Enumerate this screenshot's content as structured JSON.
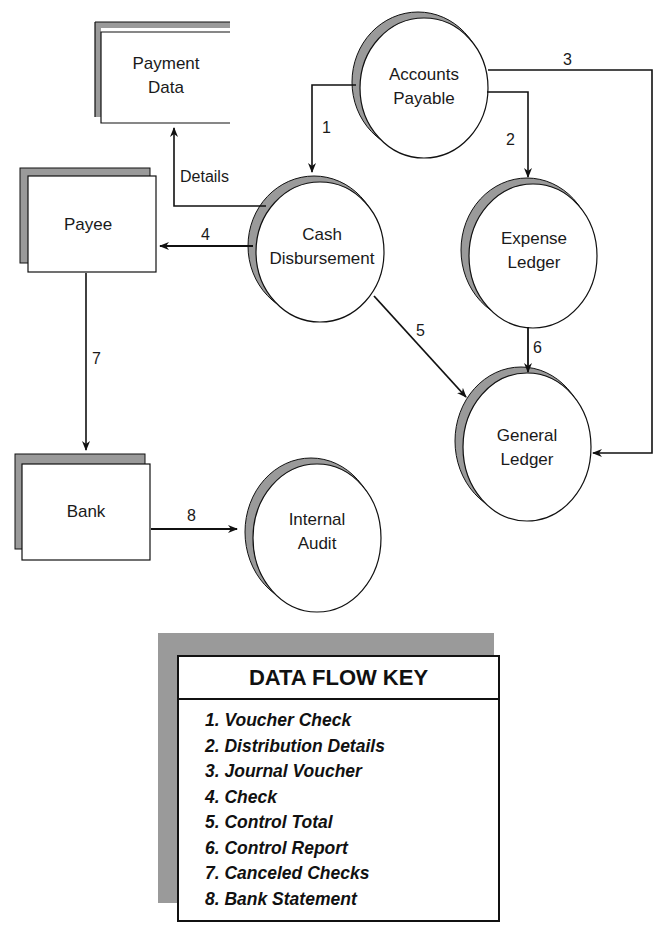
{
  "diagram": {
    "type": "data-flow-diagram",
    "entities": [
      {
        "id": "payee",
        "label": "Payee"
      },
      {
        "id": "bank",
        "label": "Bank"
      }
    ],
    "data_stores": [
      {
        "id": "payment_data",
        "label_line1": "Payment",
        "label_line2": "Data"
      }
    ],
    "processes": [
      {
        "id": "accounts_payable",
        "label_line1": "Accounts",
        "label_line2": "Payable"
      },
      {
        "id": "cash_disbursement",
        "label_line1": "Cash",
        "label_line2": "Disbursement"
      },
      {
        "id": "expense_ledger",
        "label_line1": "Expense",
        "label_line2": "Ledger"
      },
      {
        "id": "general_ledger",
        "label_line1": "General",
        "label_line2": "Ledger"
      },
      {
        "id": "internal_audit",
        "label_line1": "Internal",
        "label_line2": "Audit"
      }
    ],
    "flows": [
      {
        "label": "1",
        "from": "Accounts Payable",
        "to": "Cash Disbursement"
      },
      {
        "label": "2",
        "from": "Accounts Payable",
        "to": "Expense Ledger"
      },
      {
        "label": "3",
        "from": "Accounts Payable",
        "to": "General Ledger"
      },
      {
        "label": "4",
        "from": "Cash Disbursement",
        "to": "Payee"
      },
      {
        "label": "5",
        "from": "Cash Disbursement",
        "to": "General Ledger"
      },
      {
        "label": "6",
        "from": "Expense Ledger",
        "to": "General Ledger"
      },
      {
        "label": "7",
        "from": "Payee",
        "to": "Bank"
      },
      {
        "label": "8",
        "from": "Bank",
        "to": "Internal Audit"
      },
      {
        "label": "Details",
        "from": "Cash Disbursement",
        "to": "Payment Data"
      }
    ]
  },
  "key": {
    "title": "DATA FLOW KEY",
    "items": [
      "1. Voucher Check",
      "2. Distribution Details",
      "3. Journal Voucher",
      "4. Check",
      "5. Control Total",
      "6. Control Report",
      "7. Canceled Checks",
      "8. Bank Statement"
    ]
  },
  "colors": {
    "line": "#111111",
    "shadow": "#9a9a9a",
    "background": "#ffffff"
  }
}
